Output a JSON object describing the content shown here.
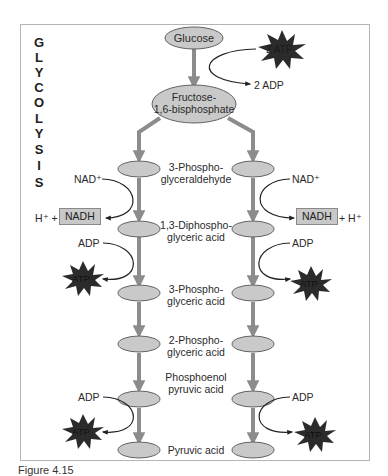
{
  "title_vertical": [
    "G",
    "L",
    "Y",
    "C",
    "O",
    "L",
    "Y",
    "S",
    "I",
    "S"
  ],
  "nodes": {
    "glucose": "Glucose",
    "fructose_line1": "Fructose-",
    "fructose_line2": "1,6-bisphosphate"
  },
  "investment": {
    "atp_in": "2 ATP",
    "adp_out": "2 ADP"
  },
  "intermediates": [
    {
      "line1": "3-Phospho-",
      "line2": "glyceraldehyde"
    },
    {
      "line1": "1,3-Diphospho-",
      "line2": "glyceric acid"
    },
    {
      "line1": "3-Phospho-",
      "line2": "glyceric acid"
    },
    {
      "line1": "2-Phospho-",
      "line2": "glyceric acid"
    },
    {
      "line1": "Phosphoenol",
      "line2": "pyruvic acid"
    },
    {
      "line1": "Pyruvic acid",
      "line2": ""
    }
  ],
  "left_side": {
    "nad": "NAD⁺",
    "h_plus": "H⁺ +",
    "nadh": "NADH",
    "adp1": "ADP",
    "atp1": "ATP",
    "adp2": "ADP",
    "atp2": "ATP"
  },
  "right_side": {
    "nad": "NAD⁺",
    "h_plus": "+ H⁺",
    "nadh": "NADH",
    "adp1": "ADP",
    "atp1": "ATP",
    "adp2": "ADP",
    "atp2": "ATP"
  },
  "caption": "Figure 4.15",
  "colors": {
    "ellipse_fill": "#c9c9c9",
    "arrow_gray": "#8c8c8c",
    "star_fill": "#2b2b2b",
    "nadh_fill": "#c8c8c8"
  }
}
